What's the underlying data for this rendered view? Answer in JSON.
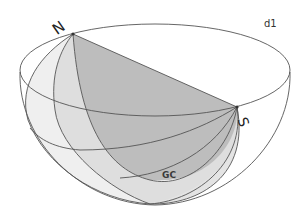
{
  "diagram": {
    "type": "hemisphere-great-circles",
    "labels": {
      "north": "N",
      "south": "S",
      "great_circle": "GC",
      "corner": "d1"
    },
    "colors": {
      "stroke": "#555555",
      "fill_light": "#ececec",
      "fill_mid": "#dadada",
      "fill_dark": "#b9b9b9",
      "background": "#ffffff"
    },
    "points": {
      "N": [
        73,
        34
      ],
      "S": [
        237,
        107
      ]
    }
  }
}
